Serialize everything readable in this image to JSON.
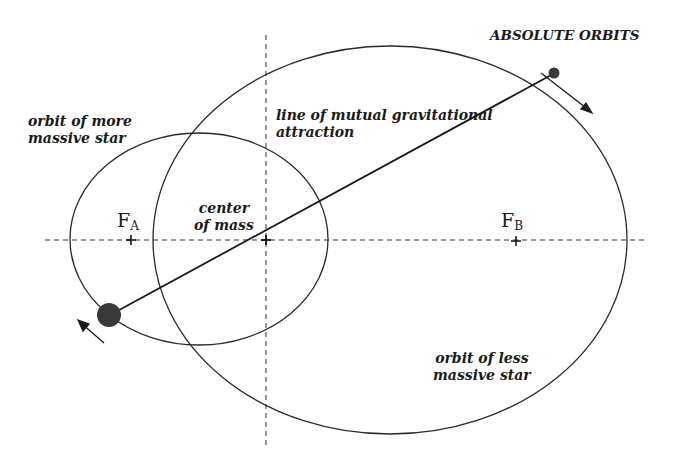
{
  "title": "ABSOLUTE ORBITS",
  "labels": {
    "orbit_more_massive": [
      "orbit of more",
      "massive star"
    ],
    "line_of_attraction": [
      "line of mutual gravitational",
      "attraction"
    ],
    "center_of_mass": [
      "center",
      "of mass"
    ],
    "orbit_less_massive": [
      "orbit of less",
      "massive star"
    ]
  },
  "foci": {
    "a": {
      "letter": "F",
      "subscript": "A"
    },
    "b": {
      "letter": "F",
      "subscript": "B"
    }
  },
  "colors": {
    "stroke": "#2a2a2a",
    "star": "#3a3a3a",
    "background": "#ffffff"
  }
}
